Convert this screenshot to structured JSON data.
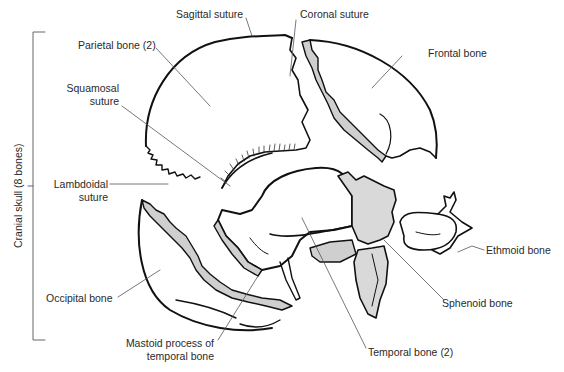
{
  "diagram": {
    "type": "anatomical-exploded-skull",
    "group_bracket": {
      "label": "Cranial skull (8 bones)"
    },
    "labels": {
      "sagittal_suture": "Sagittal suture",
      "coronal_suture": "Coronal suture",
      "parietal_bone": "Parietal bone (2)",
      "frontal_bone": "Frontal bone",
      "squamosal_suture_1": "Squamosal",
      "squamosal_suture_2": "suture",
      "lambdoidal_suture_1": "Lambdoidal",
      "lambdoidal_suture_2": "suture",
      "ethmoid_bone": "Ethmoid bone",
      "occipital_bone": "Occipital bone",
      "sphenoid_bone": "Sphenoid bone",
      "mastoid_process_1": "Mastoid process of",
      "mastoid_process_2": "temporal bone",
      "temporal_bone": "Temporal bone (2)"
    },
    "colors": {
      "outline": "#111111",
      "suture_fill": "#cfcfcf",
      "leader": "#555555",
      "text": "#2a2a2a"
    }
  }
}
